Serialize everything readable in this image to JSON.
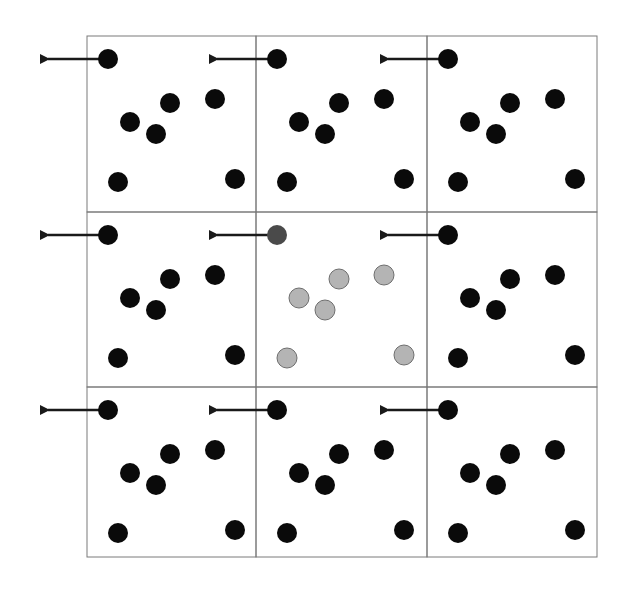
{
  "diagram": {
    "type": "periodic-boundary-conditions",
    "grid": {
      "rows": 3,
      "cols": 3,
      "x_lines": [
        87,
        256,
        427,
        597
      ],
      "y_lines": [
        36,
        212,
        387,
        557
      ],
      "line_color": "#7a7a7a"
    },
    "colors": {
      "image_particle": "#0a0a0a",
      "central_particle_fill": "#b4b4b4",
      "central_particle_stroke": "#6e6e6e",
      "exiting_particle": "#4a4a4a",
      "arrow": "#1a1a1a"
    },
    "particle_radius": 10,
    "cell_particles_relative": [
      {
        "dx": 21,
        "dy": 23,
        "moving": true
      },
      {
        "dx": 43,
        "dy": 86
      },
      {
        "dx": 83,
        "dy": 67
      },
      {
        "dx": 69,
        "dy": 98
      },
      {
        "dx": 128,
        "dy": 63
      },
      {
        "dx": 31,
        "dy": 146
      },
      {
        "dx": 148,
        "dy": 143
      }
    ],
    "central_cell": {
      "row": 1,
      "col": 1,
      "label": "simulation box"
    },
    "arrow": {
      "length": 60,
      "direction": "left"
    }
  }
}
